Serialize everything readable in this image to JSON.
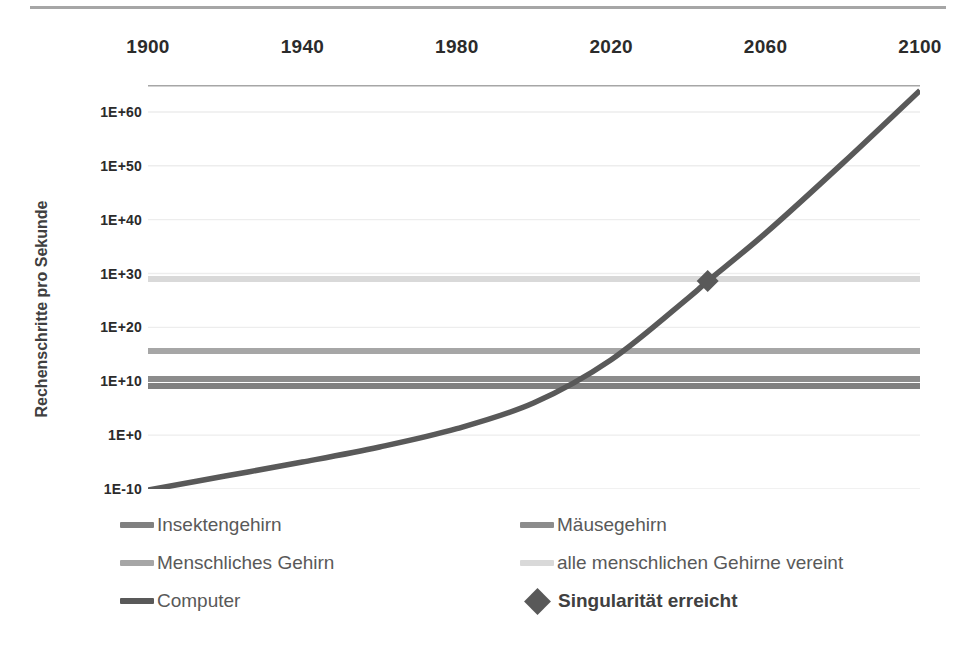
{
  "chart_data": {
    "type": "line",
    "title": "",
    "xlabel": "",
    "ylabel": "Rechenschritte pro Sekunde",
    "xlim": [
      1900,
      2100
    ],
    "ylim_log10": [
      -10,
      65
    ],
    "xticks": [
      "1900",
      "1940",
      "1980",
      "2020",
      "2060",
      "2100"
    ],
    "xtick_values": [
      1900,
      1940,
      1980,
      2020,
      2060,
      2100
    ],
    "yticks": [
      "1E+60",
      "1E+50",
      "1E+40",
      "1E+30",
      "1E+20",
      "1E+10",
      "1E+0",
      "1E-10"
    ],
    "ytick_values": [
      60,
      50,
      40,
      30,
      20,
      10,
      0,
      -10
    ],
    "grid": true,
    "xtick_position": "top",
    "legend_position": "bottom",
    "series": [
      {
        "name": "Insektengehirn",
        "type": "constant-line",
        "value_log10": 9.1,
        "color": "#808080",
        "x": [
          1900,
          2100
        ],
        "y_log10": [
          9.1,
          9.1
        ]
      },
      {
        "name": "Mäusegehirn",
        "type": "constant-line",
        "value_log10": 10.4,
        "color": "#8c8c8c",
        "x": [
          1900,
          2100
        ],
        "y_log10": [
          10.4,
          10.4
        ]
      },
      {
        "name": "Menschliches Gehirn",
        "type": "constant-line",
        "value_log10": 15.6,
        "color": "#a6a6a6",
        "x": [
          1900,
          2100
        ],
        "y_log10": [
          15.6,
          15.6
        ]
      },
      {
        "name": "alle menschlichen Gehirne vereint",
        "type": "constant-line",
        "value_log10": 29.0,
        "color": "#d9d9d9",
        "x": [
          1900,
          2100
        ],
        "y_log10": [
          29.0,
          29.0
        ]
      },
      {
        "name": "Computer",
        "type": "curve",
        "color": "#595959",
        "x": [
          1900,
          1920,
          1940,
          1960,
          1980,
          2000,
          2020,
          2040,
          2045,
          2060,
          2080,
          2100
        ],
        "y_log10": [
          -10.2,
          -7.6,
          -5.0,
          -2.2,
          1.2,
          6.0,
          14.0,
          25.5,
          28.6,
          37.5,
          50.5,
          64.0
        ]
      }
    ],
    "markers": [
      {
        "name": "Singularität erreicht",
        "x": 2045,
        "y_log10": 28.6,
        "shape": "diamond",
        "color": "#595959"
      }
    ]
  },
  "legend": {
    "column_left": [
      {
        "label": "Insektengehirn",
        "color": "#808080",
        "marker": "line",
        "bold": false
      },
      {
        "label": "Menschliches Gehirn",
        "color": "#a6a6a6",
        "marker": "line",
        "bold": false
      },
      {
        "label": "Computer",
        "color": "#595959",
        "marker": "line",
        "bold": false
      }
    ],
    "column_right": [
      {
        "label": "Mäusegehirn",
        "color": "#8c8c8c",
        "marker": "line",
        "bold": false
      },
      {
        "label": "alle menschlichen Gehirne vereint",
        "color": "#d9d9d9",
        "marker": "line",
        "bold": false
      },
      {
        "label": "Singularität erreicht",
        "color": "#595959",
        "marker": "diamond",
        "bold": true
      }
    ]
  },
  "axis": {
    "y_title": "Rechenschritte pro Sekunde"
  },
  "colors": {
    "gridline": "#ededed",
    "axis_line": "#a6a6a6",
    "top_rule": "#a6a6a6",
    "text": "#404040",
    "tick_text": "#2b2b2b"
  }
}
